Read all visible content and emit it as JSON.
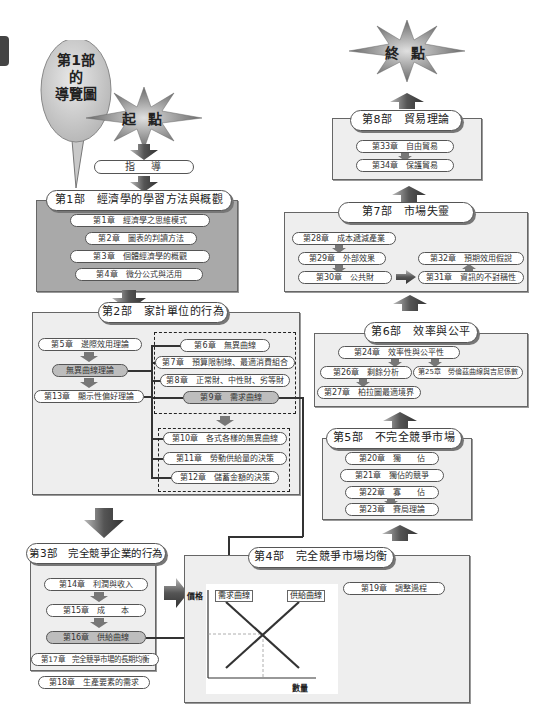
{
  "guide_bubble": {
    "line1": "第1部",
    "line2": "的",
    "line3": "導覽圖"
  },
  "start": {
    "label": "起 點"
  },
  "end": {
    "label": "終 點"
  },
  "guide": {
    "label": "指　導"
  },
  "part1": {
    "title": "第1部　經濟學的學習方法與概觀",
    "chapters": [
      "第1章　經濟學之思維模式",
      "第2章　圖表的判讀方法",
      "第3章　個體經濟學的概觀",
      "第4章　微分公式與活用"
    ]
  },
  "part2": {
    "title": "第2部　家計單位的行為",
    "left": {
      "ch5": "第5章　邊際效用理論",
      "indiff": "無異曲線理論",
      "ch13": "第13章　顯示性偏好理論"
    },
    "group1": [
      "第6章　無異曲線",
      "第7章　預算限制線、最適消費組合",
      "第8章　正常財、中性財、劣等財",
      "第9章　需求曲線"
    ],
    "group2": [
      "第10章　各式各樣的無異曲線",
      "第11章　勞動供給量的決策",
      "第12章　儲蓄金額的決策"
    ]
  },
  "part3": {
    "title": "第3部　完全競爭企業的行為",
    "chapters": [
      "第14章　利潤與收入",
      "第15章　成　　本",
      "第16章　供給曲線",
      "第17章　完全競爭市場的長期均衡",
      "第18章　生產要素的需求"
    ]
  },
  "part4": {
    "title": "第4部　完全競爭市場均衡",
    "chapter": "第19章　調整過程",
    "graph": {
      "ylabel": "價格",
      "xlabel": "數量",
      "demand_label": "需求曲線",
      "supply_label": "供給曲線"
    }
  },
  "part5": {
    "title": "第5部　不完全競爭市場",
    "chapters": [
      "第20章　獨　　佔",
      "第21章　獨佔的競爭",
      "第22章　寡　　佔",
      "第23章　賽局理論"
    ]
  },
  "part6": {
    "title": "第6部　效率與公平",
    "chapters": {
      "ch24": "第24章　效率性與公平性",
      "ch26": "第26章　剩餘分析",
      "ch25": "第25章　勞倫茲曲線與吉尼係數",
      "ch27": "第27章　柏拉圖最適境界"
    }
  },
  "part7": {
    "title": "第7部　市場失靈",
    "chapters": {
      "ch28": "第28章　成本遞減產業",
      "ch29": "第29章　外部效果",
      "ch30": "第30章　公共財",
      "ch32": "第32章　預期效用假說",
      "ch31": "第31章　資訊的不對稱性"
    }
  },
  "part8": {
    "title": "第8部　貿易理論",
    "chapters": [
      "第33章　自由貿易",
      "第34章　保護貿易"
    ]
  }
}
